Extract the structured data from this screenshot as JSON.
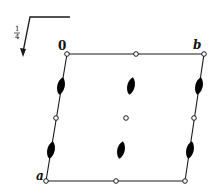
{
  "diagram": {
    "type": "space-group-symmetry-diagram",
    "height_indicator": {
      "label_num": "1",
      "label_den": "4"
    },
    "labels": {
      "origin": "0",
      "axis_b": "b",
      "axis_a": "a"
    },
    "colors": {
      "line": "#1a1a1a",
      "symbol_fill": "#000000",
      "background": "#ffffff"
    },
    "corners": {
      "origin": [
        67,
        54
      ],
      "b": [
        204,
        54
      ],
      "a": [
        46,
        181
      ],
      "ab": [
        185,
        181
      ]
    },
    "inversion_centers": [
      [
        67,
        54
      ],
      [
        136,
        54
      ],
      [
        204,
        54
      ],
      [
        56,
        118
      ],
      [
        126,
        118
      ],
      [
        194,
        118
      ],
      [
        46,
        181
      ],
      [
        116,
        181
      ],
      [
        185,
        181
      ]
    ],
    "twofold_screw_axes": [
      [
        61,
        86
      ],
      [
        131,
        86
      ],
      [
        199,
        86
      ],
      [
        51,
        150
      ],
      [
        121,
        150
      ],
      [
        190,
        150
      ]
    ]
  }
}
